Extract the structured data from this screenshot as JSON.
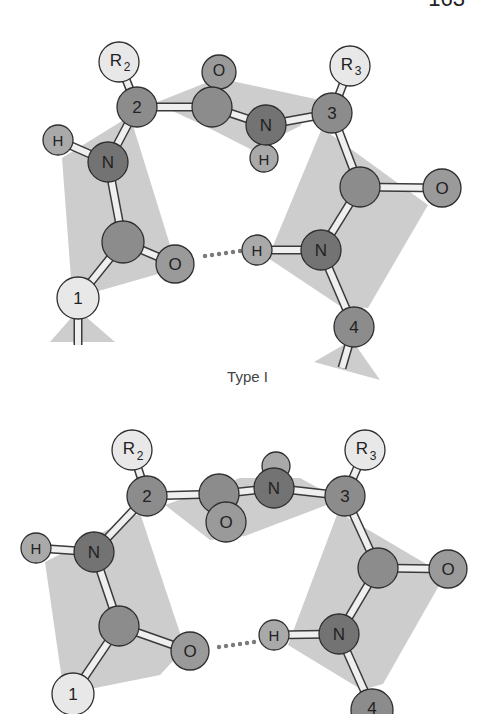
{
  "page": {
    "number": "163"
  },
  "colors": {
    "plane": "#cdcdcd",
    "carbon": "#8c8c8c",
    "nitrogen": "#737373",
    "oxygen": "#9a9a9a",
    "hydrogen": "#a9a9a9",
    "residue": "#e8e8e8",
    "alpha": "#8c8c8c",
    "bond": "#efefef"
  },
  "diagrams": [
    {
      "caption": "Type I",
      "labels": {
        "r2": "R",
        "r2_sub": "2",
        "a2": "2",
        "o_top": "O",
        "n_mid": "N",
        "h_mid": "H",
        "r3": "R",
        "r3_sub": "3",
        "a3": "3",
        "o_right": "O",
        "h_left": "H",
        "n_left": "N",
        "o_left": "O",
        "a1": "1",
        "h_right": "H",
        "n_right": "N",
        "a4": "4"
      }
    },
    {
      "caption": "",
      "labels": {
        "r2": "R",
        "r2_sub": "2",
        "a2": "2",
        "o_mid": "O",
        "n_mid": "N",
        "r3": "R",
        "r3_sub": "3",
        "a3": "3",
        "o_right": "O",
        "h_left": "H",
        "n_left": "N",
        "o_left": "O",
        "a1": "1",
        "h_right": "H",
        "n_right": "N",
        "a4": "4"
      }
    }
  ]
}
